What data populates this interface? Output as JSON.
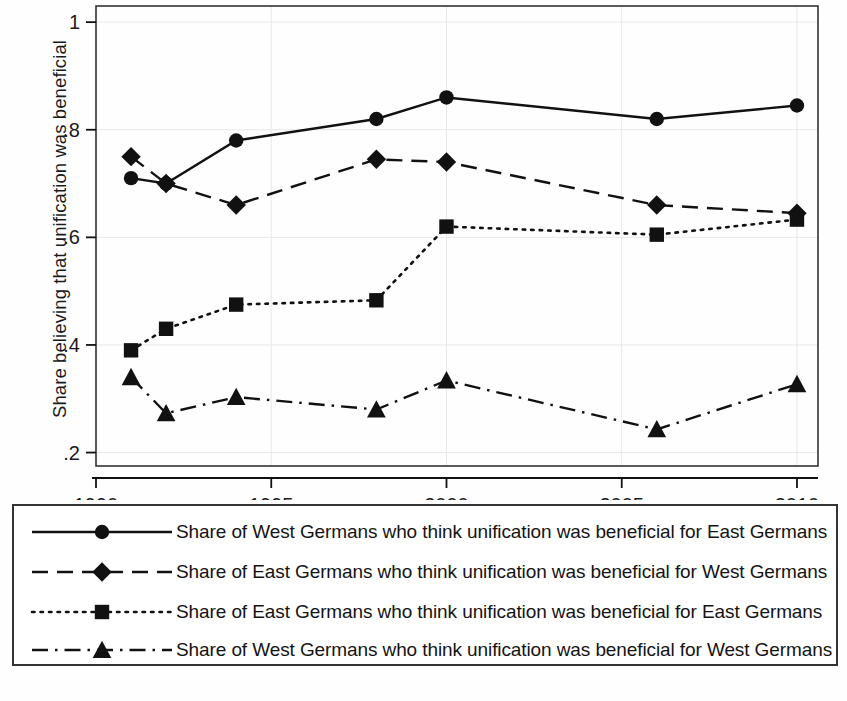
{
  "chart_data": {
    "type": "line",
    "title": "",
    "xlabel": "",
    "ylabel": "Share believing that unification was beneficial",
    "xlim": [
      1990,
      2010.6
    ],
    "ylim": [
      0.175,
      1.03
    ],
    "x_ticks": [
      1990,
      1995,
      2000,
      2005,
      2010
    ],
    "x_tick_labels": [
      "1990",
      "1995",
      "2000",
      "2005",
      "2010"
    ],
    "y_ticks": [
      0.2,
      0.4,
      0.6,
      0.8,
      1
    ],
    "y_tick_labels": [
      ".2",
      ".4",
      ".6",
      ".8",
      "1"
    ],
    "grid": true,
    "legend_position": "below-plot",
    "x": [
      1991,
      1992,
      1994,
      1998,
      2000,
      2006,
      2010
    ],
    "series": [
      {
        "name": "Share of West Germans who think unification was beneficial for East Germans",
        "marker": "circle",
        "linestyle": "solid",
        "values": [
          0.71,
          0.7,
          0.78,
          0.82,
          0.86,
          0.82,
          0.845
        ]
      },
      {
        "name": "Share of East Germans who think unification was beneficial for West Germans",
        "marker": "diamond",
        "linestyle": "dashed",
        "values": [
          0.75,
          0.7,
          0.66,
          0.745,
          0.74,
          0.66,
          0.645
        ]
      },
      {
        "name": "Share of East Germans who think unification was beneficial for East Germans",
        "marker": "square",
        "linestyle": "dotted",
        "values": [
          0.39,
          0.43,
          0.475,
          0.483,
          0.62,
          0.605,
          0.633
        ]
      },
      {
        "name": "Share of West Germans who think unification was beneficial for West Germans",
        "marker": "triangle",
        "linestyle": "dashdot",
        "values": [
          0.34,
          0.273,
          0.303,
          0.28,
          0.334,
          0.243,
          0.327
        ]
      }
    ]
  },
  "legend": {
    "items": [
      {
        "label": "Share of West Germans who think unification was beneficial for East Germans",
        "marker": "circle",
        "linestyle": "solid"
      },
      {
        "label": "Share of East Germans who think unification was beneficial for West Germans",
        "marker": "diamond",
        "linestyle": "dashed"
      },
      {
        "label": "Share of East Germans who think unification was beneficial for East Germans",
        "marker": "square",
        "linestyle": "dotted"
      },
      {
        "label": "Share of West Germans who think unification was beneficial for West Germans",
        "marker": "triangle",
        "linestyle": "dashdot"
      }
    ]
  },
  "colors": {
    "ink": "#111111",
    "frame": "#333333",
    "grid": "#e8e8e8",
    "background": "#ffffff"
  }
}
